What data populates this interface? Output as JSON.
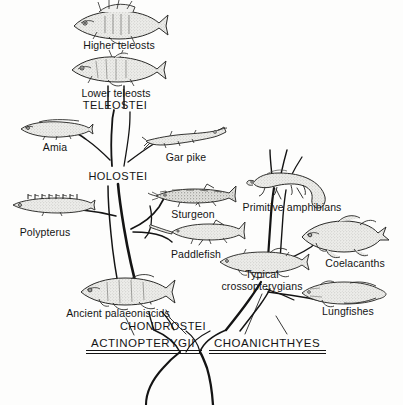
{
  "figure": {
    "type": "phylogenetic-tree",
    "background_color": "#fdfdfc",
    "ink_color": "#141414",
    "width": 403,
    "height": 405
  },
  "organisms": [
    {
      "id": "higher-teleosts",
      "label": "Higher teleosts",
      "x": 119,
      "y": 11,
      "label_x": 119,
      "label_y": 40,
      "art": "perch"
    },
    {
      "id": "lower-teleosts",
      "label": "Lower teleosts",
      "x": 116,
      "y": 56,
      "label_x": 116,
      "label_y": 88,
      "art": "herring"
    },
    {
      "id": "amia",
      "label": "Amia",
      "x": 55,
      "y": 119,
      "label_x": 55,
      "label_y": 142,
      "art": "bowfin"
    },
    {
      "id": "gar-pike",
      "label": "Gar pike",
      "x": 186,
      "y": 130,
      "label_x": 186,
      "label_y": 152,
      "art": "gar"
    },
    {
      "id": "polypterus",
      "label": "Polypterus",
      "x": 52,
      "y": 198,
      "label_x": 45,
      "label_y": 227,
      "art": "polypterus"
    },
    {
      "id": "sturgeon",
      "label": "Sturgeon",
      "x": 196,
      "y": 188,
      "label_x": 193,
      "label_y": 209,
      "art": "sturgeon"
    },
    {
      "id": "paddlefish",
      "label": "Paddlefish",
      "x": 199,
      "y": 225,
      "label_x": 196,
      "label_y": 249,
      "art": "paddlefish"
    },
    {
      "id": "primitive-amphibians",
      "label": "Primitive amphibians",
      "x": 285,
      "y": 172,
      "label_x": 292,
      "label_y": 202,
      "art": "amphibian"
    },
    {
      "id": "coelacanths",
      "label": "Coelacanths",
      "x": 340,
      "y": 227,
      "label_x": 355,
      "label_y": 258,
      "art": "coelacanth"
    },
    {
      "id": "typical-crossopterygians",
      "label": "Typical\ncrossopterygians",
      "x": 262,
      "y": 253,
      "label_x": 262,
      "label_y": 270,
      "art": "crossopterygian"
    },
    {
      "id": "lungfishes",
      "label": "Lungfishes",
      "x": 340,
      "y": 283,
      "label_x": 348,
      "label_y": 306,
      "art": "lungfish"
    },
    {
      "id": "ancient-palaeoniscids",
      "label": "Ancient palaeoniscids",
      "x": 125,
      "y": 281,
      "label_x": 118,
      "label_y": 308,
      "art": "palaeoniscid"
    }
  ],
  "taxon_labels": [
    {
      "id": "teleostei",
      "text": "TELEOSTEI",
      "x": 115,
      "y": 100,
      "style": "taxon"
    },
    {
      "id": "holostei",
      "text": "HOLOSTEI",
      "x": 118,
      "y": 171,
      "style": "taxon"
    },
    {
      "id": "chondrostei",
      "text": "CHONDROSTEI",
      "x": 163,
      "y": 321,
      "style": "taxon"
    }
  ],
  "major_groups": [
    {
      "id": "actinopterygii",
      "text": "ACTINOPTERYGII",
      "x": 143,
      "y": 339,
      "underline": {
        "x": 86,
        "y": 350,
        "width": 116
      }
    },
    {
      "id": "choanichthyes",
      "text": "CHOANICHTHYES",
      "x": 267,
      "y": 339,
      "underline": {
        "x": 209,
        "y": 350,
        "width": 117
      }
    }
  ],
  "branches": {
    "description": "Hand-drawn tapered tree branches in black ink connecting ancestral stocks to descendants",
    "trunk_base_x": 201,
    "trunk_base_y": 405
  }
}
